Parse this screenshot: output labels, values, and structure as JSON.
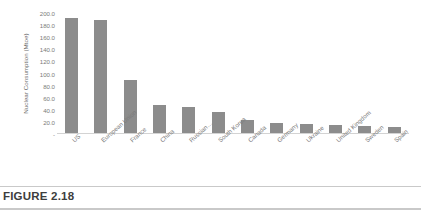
{
  "figure": {
    "caption": "FIGURE 2.18"
  },
  "chart_data": {
    "type": "bar",
    "title": "",
    "xlabel": "",
    "ylabel": "Nuclear Consumption (Mtoe)",
    "ylim": [
      0,
      200
    ],
    "ytick_labels": [
      "200.0",
      "180.0",
      "160.0",
      "140.0",
      "120.0",
      "100.0",
      "80.0",
      "60.0",
      "40.0",
      "20.0",
      "-"
    ],
    "ytick_values": [
      200,
      180,
      160,
      140,
      120,
      100,
      80,
      60,
      40,
      20,
      0
    ],
    "grid": false,
    "legend": false,
    "bar_color": "#8c8c8c",
    "categories": [
      "US",
      "European Union",
      "France",
      "China",
      "Russian…",
      "South Korea",
      "Canada",
      "Germany",
      "Ukraine",
      "United Kingdom",
      "Sweden",
      "Spain"
    ],
    "values": [
      191,
      189,
      89,
      47,
      43,
      35,
      21,
      16,
      15,
      13,
      11,
      10
    ]
  }
}
